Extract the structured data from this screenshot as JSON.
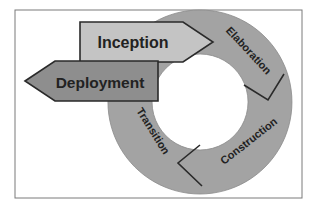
{
  "diagram": {
    "colors": {
      "frame": "#7a7a7a",
      "ring": "#a3a3a3",
      "inception": "#c4c4c4",
      "deployment": "#8e8e8e",
      "outline": "#2a2a2a",
      "text": "#222222"
    },
    "arrows": [
      {
        "id": "inception",
        "label": "Inception"
      },
      {
        "id": "deployment",
        "label": "Deployment"
      }
    ],
    "ring_segments": [
      {
        "id": "elaboration",
        "label": "Elaboration"
      },
      {
        "id": "construction",
        "label": "Construction"
      },
      {
        "id": "transition",
        "label": "Transition"
      }
    ]
  }
}
